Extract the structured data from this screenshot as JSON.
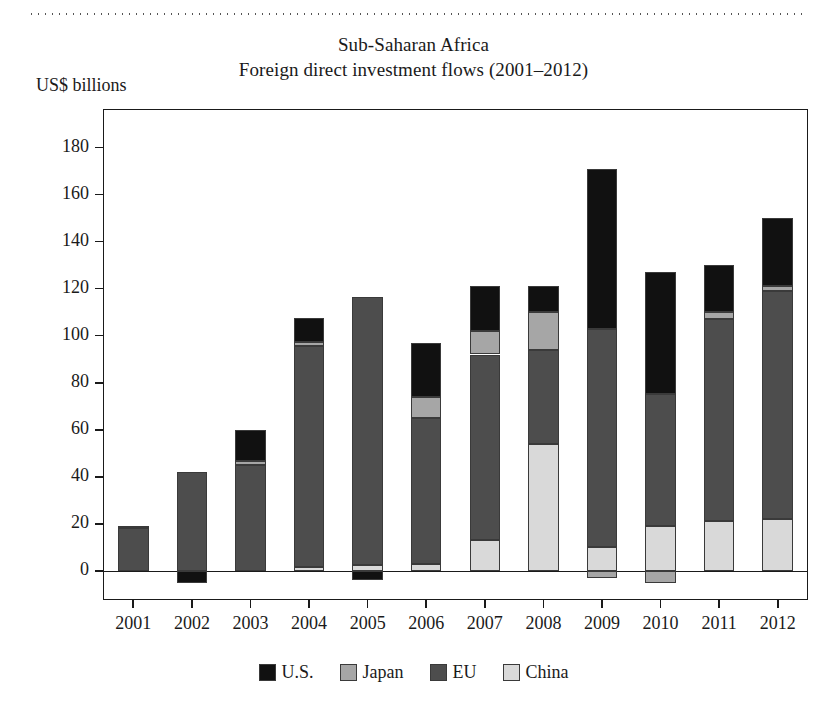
{
  "chart_data": {
    "type": "bar",
    "subtype": "stacked-bar",
    "title": "Sub-Saharan Africa",
    "subtitle": "Foreign direct investment flows (2001–2012)",
    "ylabel": "US$ billions",
    "xlabel": "",
    "categories": [
      "2001",
      "2002",
      "2003",
      "2004",
      "2005",
      "2006",
      "2007",
      "2008",
      "2009",
      "2010",
      "2011",
      "2012"
    ],
    "series": [
      {
        "name": "China",
        "color": "#d9d9d9",
        "values": [
          0,
          0,
          0,
          1.5,
          2.5,
          3,
          13,
          54,
          10,
          19,
          21,
          22
        ]
      },
      {
        "name": "EU",
        "color": "#4d4d4d",
        "values": [
          18,
          42,
          45,
          94,
          114,
          62,
          79,
          40,
          93,
          56,
          86,
          97
        ]
      },
      {
        "name": "Japan",
        "color": "#a6a6a6",
        "values": [
          1,
          0,
          1.5,
          2,
          0,
          9,
          10,
          16,
          0,
          0,
          3,
          2
        ]
      },
      {
        "name": "U.S.",
        "color": "#111111",
        "values": [
          0,
          0,
          13.5,
          10,
          0,
          23,
          19,
          11,
          68,
          52,
          20,
          29
        ]
      }
    ],
    "negative_series": [
      {
        "name": "U.S.",
        "color": "#111111",
        "values": [
          0,
          -5,
          0,
          0,
          -4,
          0,
          0,
          0,
          0,
          0,
          0,
          0
        ]
      },
      {
        "name": "Japan",
        "color": "#a6a6a6",
        "values": [
          0,
          0,
          0,
          0,
          0,
          0,
          0,
          0,
          -3,
          -5,
          0,
          0
        ]
      }
    ],
    "stack_totals": [
      19,
      42,
      60,
      107.5,
      116.5,
      97,
      121,
      121,
      171,
      127,
      130,
      150
    ],
    "yticks": [
      0,
      20,
      40,
      60,
      80,
      100,
      120,
      140,
      160,
      180
    ],
    "ylim": [
      -12,
      196
    ],
    "grid": false,
    "legend_position": "bottom",
    "legend": [
      {
        "label": "U.S.",
        "color": "#111111"
      },
      {
        "label": "Japan",
        "color": "#a6a6a6"
      },
      {
        "label": "EU",
        "color": "#4d4d4d"
      },
      {
        "label": "China",
        "color": "#d9d9d9"
      }
    ]
  }
}
